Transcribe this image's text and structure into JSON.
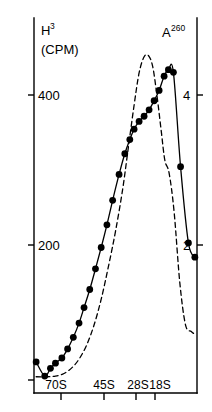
{
  "chart_data": {
    "type": "line",
    "title": "",
    "subtitle": "",
    "xlabel": "",
    "ylabel": "H3 (CPM)",
    "y2label": "A260",
    "grid": false,
    "legend_position": "none",
    "x_axis": {
      "tick_labels": [
        "70S",
        "45S",
        "28S",
        "18S"
      ],
      "tick_positions": [
        2.6,
        5.6,
        7.8,
        9.1
      ],
      "range": [
        0,
        11.4
      ]
    },
    "y_axis_left": {
      "label": "H3",
      "units": "(CPM)",
      "tick_labels": [
        "200",
        "400"
      ],
      "tick_values": [
        200,
        400
      ],
      "range": [
        0,
        560
      ]
    },
    "y_axis_right": {
      "label": "A260",
      "tick_labels": [
        "2",
        "4"
      ],
      "tick_values": [
        2,
        4
      ],
      "range": [
        0,
        5.6
      ]
    },
    "series": [
      {
        "name": "H3 (CPM)",
        "style": "solid-with-markers",
        "axis": "left",
        "x": [
          0.15,
          0.75,
          1.15,
          1.5,
          1.95,
          2.35,
          2.75,
          3.15,
          3.5,
          3.9,
          4.3,
          4.7,
          5.1,
          5.5,
          5.95,
          6.35,
          6.7,
          7.0,
          7.35,
          7.7,
          8.05,
          8.4,
          8.75,
          9.1,
          9.4,
          9.75,
          10.25,
          10.8,
          11.25
        ],
        "y": [
          28,
          6,
          18,
          26,
          34,
          48,
          66,
          88,
          112,
          140,
          172,
          205,
          240,
          278,
          318,
          350,
          372,
          388,
          400,
          408,
          418,
          432,
          448,
          470,
          480,
          476,
          330,
          212,
          190
        ]
      },
      {
        "name": "A260",
        "style": "dashed",
        "axis": "right",
        "x": [
          0.15,
          0.9,
          1.5,
          2.1,
          2.7,
          3.2,
          3.7,
          4.2,
          4.7,
          5.2,
          5.7,
          6.2,
          6.6,
          7.0,
          7.35,
          7.7,
          8.0,
          8.3,
          8.6,
          8.9,
          9.15,
          9.45,
          9.8,
          10.2,
          10.6,
          11.0,
          11.3
        ],
        "y": [
          0.05,
          0.05,
          0.06,
          0.1,
          0.2,
          0.34,
          0.55,
          0.85,
          1.25,
          1.75,
          2.3,
          2.95,
          3.6,
          4.25,
          4.75,
          5.0,
          5.02,
          4.85,
          4.4,
          3.85,
          3.4,
          3.2,
          2.6,
          1.5,
          0.85,
          0.75,
          0.7
        ]
      }
    ],
    "annotations": []
  },
  "labels": {
    "y_left_title": "H",
    "y_left_title_sup": "3",
    "y_left_units": "(CPM)",
    "y_right_title": "A",
    "y_right_title_sup": "260"
  },
  "colors": {
    "ink": "#000000",
    "background": "#ffffff"
  }
}
